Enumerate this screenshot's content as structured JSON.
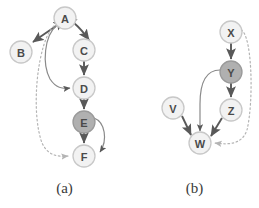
{
  "figure": {
    "panels": [
      {
        "id": "a",
        "caption": "(a)",
        "nodes": [
          {
            "id": "A",
            "label": "A",
            "cx": 65,
            "cy": 18,
            "r": 11,
            "fill": "#f2f2f2",
            "stroke": "#c8c8c8",
            "highlighted": false
          },
          {
            "id": "B",
            "label": "B",
            "cx": 21,
            "cy": 52,
            "r": 11,
            "fill": "#f2f2f2",
            "stroke": "#c8c8c8",
            "highlighted": false
          },
          {
            "id": "C",
            "label": "C",
            "cx": 84,
            "cy": 50,
            "r": 11,
            "fill": "#f2f2f2",
            "stroke": "#c8c8c8",
            "highlighted": false
          },
          {
            "id": "D",
            "label": "D",
            "cx": 84,
            "cy": 88,
            "r": 11,
            "fill": "#f2f2f2",
            "stroke": "#c8c8c8",
            "highlighted": false
          },
          {
            "id": "E",
            "label": "E",
            "cx": 84,
            "cy": 122,
            "r": 11,
            "fill": "#b0b0b0",
            "stroke": "#9a9a9a",
            "highlighted": true
          },
          {
            "id": "F",
            "label": "F",
            "cx": 84,
            "cy": 156,
            "r": 11,
            "fill": "#f2f2f2",
            "stroke": "#c8c8c8",
            "highlighted": false
          }
        ],
        "edges": [
          {
            "from": "A",
            "to": "B",
            "style": "solid",
            "arrows": "both",
            "shape": "curve"
          },
          {
            "from": "A",
            "to": "C",
            "style": "solid",
            "arrows": "both",
            "shape": "curve"
          },
          {
            "from": "C",
            "to": "D",
            "style": "solid",
            "arrows": "end",
            "shape": "straight"
          },
          {
            "from": "A",
            "to": "D",
            "style": "solid",
            "arrows": "end",
            "shape": "curve"
          },
          {
            "from": "D",
            "to": "E",
            "style": "solid",
            "arrows": "end",
            "shape": "straight"
          },
          {
            "from": "E",
            "to": "F",
            "style": "solid",
            "arrows": "end",
            "shape": "straight"
          },
          {
            "from": "E",
            "to": "F",
            "style": "solid",
            "arrows": "end",
            "shape": "curve-right"
          },
          {
            "from": "A",
            "to": "F",
            "style": "dotted",
            "arrows": "end",
            "shape": "curve-left"
          }
        ]
      },
      {
        "id": "b",
        "caption": "(b)",
        "nodes": [
          {
            "id": "X",
            "label": "X",
            "cx": 101,
            "cy": 32,
            "r": 11,
            "fill": "#f2f2f2",
            "stroke": "#c8c8c8",
            "highlighted": false
          },
          {
            "id": "Y",
            "label": "Y",
            "cx": 101,
            "cy": 72,
            "r": 11,
            "fill": "#b0b0b0",
            "stroke": "#9a9a9a",
            "highlighted": true
          },
          {
            "id": "Z",
            "label": "Z",
            "cx": 101,
            "cy": 110,
            "r": 11,
            "fill": "#f2f2f2",
            "stroke": "#c8c8c8",
            "highlighted": false
          },
          {
            "id": "V",
            "label": "V",
            "cx": 43,
            "cy": 108,
            "r": 11,
            "fill": "#f2f2f2",
            "stroke": "#c8c8c8",
            "highlighted": false
          },
          {
            "id": "W",
            "label": "W",
            "cx": 70,
            "cy": 143,
            "r": 11,
            "fill": "#f2f2f2",
            "stroke": "#c8c8c8",
            "highlighted": false
          }
        ],
        "edges": [
          {
            "from": "X",
            "to": "Y",
            "style": "solid",
            "arrows": "end",
            "shape": "straight"
          },
          {
            "from": "Y",
            "to": "Z",
            "style": "solid",
            "arrows": "end",
            "shape": "straight"
          },
          {
            "from": "Z",
            "to": "W",
            "style": "solid",
            "arrows": "end",
            "shape": "straight"
          },
          {
            "from": "V",
            "to": "W",
            "style": "solid",
            "arrows": "end",
            "shape": "straight"
          },
          {
            "from": "Y",
            "to": "W",
            "style": "solid",
            "arrows": "end",
            "shape": "curve-left"
          },
          {
            "from": "X",
            "to": "W",
            "style": "dotted",
            "arrows": "end",
            "shape": "curve-right"
          }
        ]
      }
    ],
    "colors": {
      "node_fill_default": "#f2f2f2",
      "node_fill_highlighted": "#b0b0b0",
      "node_stroke_default": "#c8c8c8",
      "node_stroke_highlighted": "#9a9a9a",
      "edge_solid": "#595959",
      "edge_dotted": "#b4b4b4",
      "label_text": "#4a4a4a",
      "caption_text": "#3a3a3a",
      "background": "#ffffff"
    }
  }
}
